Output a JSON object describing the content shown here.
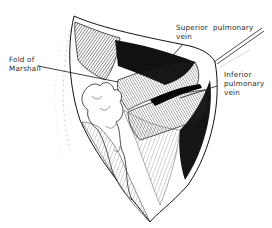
{
  "figure": {
    "type": "anatomical-illustration",
    "style": "black-and-white line drawing",
    "labels": {
      "fold_of_marshall": {
        "line1": "Fold of",
        "line2": "Marshall"
      },
      "superior_pulmonary_vein": {
        "line1": "Superior  pulmonary",
        "line2": "vein"
      },
      "inferior_pulmonary_vein": {
        "line1": "Inferior",
        "line2": "pulmonary",
        "line3": "vein"
      }
    },
    "colors": {
      "ink": "#111111",
      "paper": "#ffffff"
    }
  }
}
